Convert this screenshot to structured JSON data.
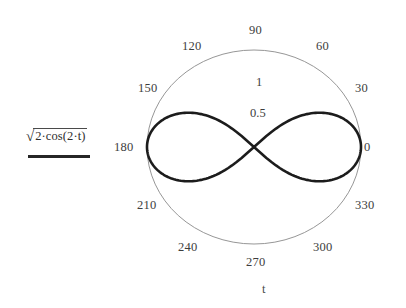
{
  "plot": {
    "type": "polar",
    "variable_label": "t",
    "legend": {
      "sqrt_symbol": "√",
      "expression_radicand": "2·cos(2·t)",
      "expression_full": "√(2·cos(2·t))",
      "line_color": "#262626"
    },
    "angle_labels": [
      {
        "value": "0",
        "deg": 0
      },
      {
        "value": "30",
        "deg": 30
      },
      {
        "value": "60",
        "deg": 60
      },
      {
        "value": "90",
        "deg": 90
      },
      {
        "value": "120",
        "deg": 120
      },
      {
        "value": "150",
        "deg": 150
      },
      {
        "value": "180",
        "deg": 180
      },
      {
        "value": "210",
        "deg": 210
      },
      {
        "value": "240",
        "deg": 240
      },
      {
        "value": "270",
        "deg": 270
      },
      {
        "value": "300",
        "deg": 300
      },
      {
        "value": "330",
        "deg": 330
      }
    ],
    "radial_labels": [
      {
        "value": "1",
        "r": 1
      },
      {
        "value": "0.5",
        "r": 0.5
      }
    ],
    "boundary_color": "#8a8a8a",
    "curve_color": "#1c1c1c"
  },
  "chart_data": {
    "type": "line",
    "title": "",
    "subtitle": "",
    "xlabel": "t",
    "ylabel": "",
    "coordinate_system": "polar",
    "angle_unit": "degrees",
    "grid": false,
    "legend_position": "left",
    "axis_ranges": {
      "theta": [
        0,
        360
      ],
      "r": [
        0,
        1
      ]
    },
    "theta_ticks": [
      0,
      30,
      60,
      90,
      120,
      150,
      180,
      210,
      240,
      270,
      300,
      330
    ],
    "theta_tick_labels": [
      "0",
      "30",
      "60",
      "90",
      "120",
      "150",
      "180",
      "210",
      "240",
      "270",
      "300",
      "330"
    ],
    "r_ticks": [
      0.5,
      1
    ],
    "r_tick_labels": [
      "0.5",
      "1"
    ],
    "series": [
      {
        "name": "√(2·cos(2·t))",
        "equation": "r = sqrt(2*cos(2*t))",
        "color": "#1c1c1c",
        "line_width": 2.6,
        "shape": "lemniscate",
        "r_max": 1.0,
        "points": [
          {
            "t": 0,
            "r": 1.0
          },
          {
            "t": 5,
            "r": 0.996
          },
          {
            "t": 10,
            "r": 0.985
          },
          {
            "t": 15,
            "r": 0.966
          },
          {
            "t": 20,
            "r": 0.94
          },
          {
            "t": 25,
            "r": 0.906
          },
          {
            "t": 30,
            "r": 0.866
          },
          {
            "t": 35,
            "r": 0.819
          },
          {
            "t": 40,
            "r": 0.766
          },
          {
            "t": 42,
            "r": 0.743
          },
          {
            "t": 44,
            "r": 0.719
          },
          {
            "t": 45,
            "r": 0.0
          },
          {
            "t": 136,
            "r": 0.719
          },
          {
            "t": 140,
            "r": 0.766
          },
          {
            "t": 145,
            "r": 0.819
          },
          {
            "t": 150,
            "r": 0.866
          },
          {
            "t": 155,
            "r": 0.906
          },
          {
            "t": 160,
            "r": 0.94
          },
          {
            "t": 165,
            "r": 0.966
          },
          {
            "t": 170,
            "r": 0.985
          },
          {
            "t": 175,
            "r": 0.996
          },
          {
            "t": 180,
            "r": 1.0
          },
          {
            "t": 185,
            "r": 0.996
          },
          {
            "t": 190,
            "r": 0.985
          },
          {
            "t": 195,
            "r": 0.966
          },
          {
            "t": 200,
            "r": 0.94
          },
          {
            "t": 205,
            "r": 0.906
          },
          {
            "t": 210,
            "r": 0.866
          },
          {
            "t": 215,
            "r": 0.819
          },
          {
            "t": 220,
            "r": 0.766
          },
          {
            "t": 225,
            "r": 0.0
          },
          {
            "t": 315,
            "r": 0.0
          },
          {
            "t": 320,
            "r": 0.766
          },
          {
            "t": 325,
            "r": 0.819
          },
          {
            "t": 330,
            "r": 0.866
          },
          {
            "t": 335,
            "r": 0.906
          },
          {
            "t": 340,
            "r": 0.94
          },
          {
            "t": 345,
            "r": 0.966
          },
          {
            "t": 350,
            "r": 0.985
          },
          {
            "t": 355,
            "r": 0.996
          },
          {
            "t": 360,
            "r": 1.0
          }
        ]
      }
    ],
    "boundary": {
      "name": "plot-boundary-circle",
      "r": 1.0,
      "color": "#8a8a8a"
    }
  }
}
